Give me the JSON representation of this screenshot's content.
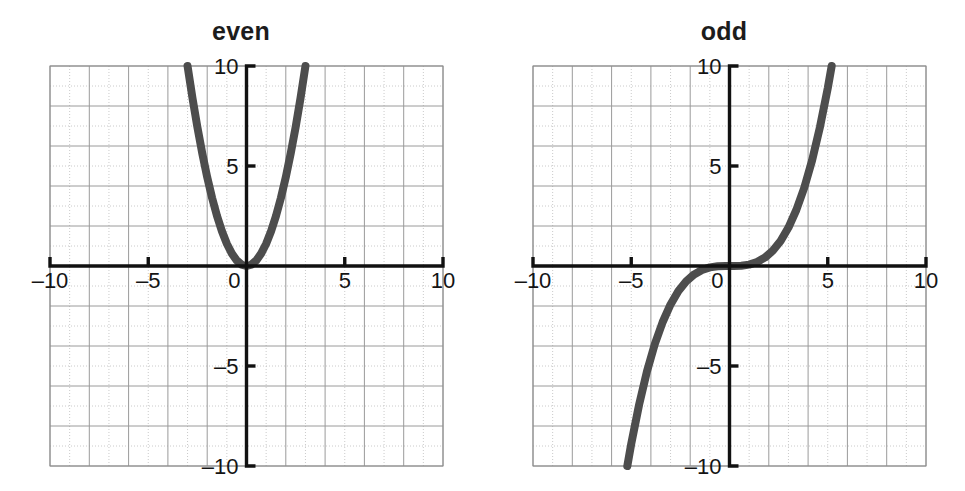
{
  "figure": {
    "width": 965,
    "height": 491,
    "background": "#ffffff",
    "curve_color": "#4d4d4d",
    "axis_color": "#111111",
    "major_grid_color": "#9a9a9a",
    "minor_grid_color": "#bcbcbc",
    "plot_border_color": "#8c8c8c"
  },
  "panels": [
    {
      "id": "even",
      "title": "even"
    },
    {
      "id": "odd",
      "title": "odd"
    }
  ],
  "chart_data": [
    {
      "type": "line",
      "title": "even",
      "xlabel": "",
      "ylabel": "",
      "xlim": [
        -10,
        10
      ],
      "ylim": [
        -10,
        10
      ],
      "grid": true,
      "grid_major_step": 2,
      "grid_minor_step": 1,
      "legend": "none",
      "xticks": [
        -10,
        -5,
        0,
        5,
        10
      ],
      "xticklabels": [
        "–10",
        "–5",
        "0",
        "5",
        "10"
      ],
      "yticks": [
        -10,
        -5,
        5,
        10
      ],
      "yticklabels": [
        "–10",
        "–5",
        "5",
        "10"
      ],
      "series": [
        {
          "name": "even function",
          "description": "upward parabola symmetric about the y-axis, vertex at the origin, reaching y = 10 at x = ±3",
          "x": [
            -3.0,
            -2.75,
            -2.5,
            -2.25,
            -2.0,
            -1.75,
            -1.5,
            -1.25,
            -1.0,
            -0.75,
            -0.5,
            -0.25,
            0.0,
            0.25,
            0.5,
            0.75,
            1.0,
            1.25,
            1.5,
            1.75,
            2.0,
            2.25,
            2.5,
            2.75,
            3.0
          ],
          "y": [
            10.0,
            8.4,
            6.94,
            5.63,
            4.44,
            3.4,
            2.5,
            1.74,
            1.11,
            0.63,
            0.28,
            0.07,
            0.0,
            0.07,
            0.28,
            0.63,
            1.11,
            1.74,
            2.5,
            3.4,
            4.44,
            5.63,
            6.94,
            8.4,
            10.0
          ]
        }
      ]
    },
    {
      "type": "line",
      "title": "odd",
      "xlabel": "",
      "ylabel": "",
      "xlim": [
        -10,
        10
      ],
      "ylim": [
        -10,
        10
      ],
      "grid": true,
      "grid_major_step": 2,
      "grid_minor_step": 1,
      "legend": "none",
      "xticks": [
        -10,
        -5,
        0,
        5,
        10
      ],
      "xticklabels": [
        "–10",
        "–5",
        "0",
        "5",
        "10"
      ],
      "yticks": [
        -10,
        -5,
        5,
        10
      ],
      "yticklabels": [
        "–10",
        "–5",
        "5",
        "10"
      ],
      "series": [
        {
          "name": "odd function",
          "description": "cubic-like curve with rotational symmetry about the origin, passing through (0,0) and reaching y = ±10 at x = ±5.2",
          "x": [
            -5.2,
            -5.0,
            -4.6,
            -4.2,
            -3.8,
            -3.4,
            -3.0,
            -2.6,
            -2.2,
            -1.8,
            -1.4,
            -1.0,
            -0.6,
            -0.2,
            0.0,
            0.2,
            0.6,
            1.0,
            1.4,
            1.8,
            2.2,
            2.6,
            3.0,
            3.4,
            3.8,
            4.2,
            4.6,
            5.0,
            5.2
          ],
          "y": [
            -10.0,
            -8.89,
            -6.93,
            -5.27,
            -3.9,
            -2.8,
            -1.92,
            -1.25,
            -0.76,
            -0.42,
            -0.2,
            -0.07,
            -0.015,
            -0.0005,
            0.0,
            0.0005,
            0.015,
            0.07,
            0.2,
            0.42,
            0.76,
            1.25,
            1.92,
            2.8,
            3.9,
            5.27,
            6.93,
            8.89,
            10.0
          ]
        }
      ]
    }
  ]
}
